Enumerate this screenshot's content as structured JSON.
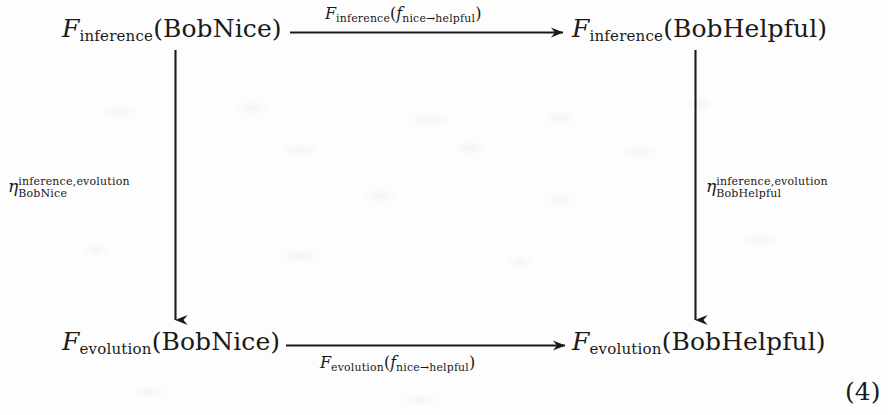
{
  "diagram": {
    "type": "commutative-square",
    "equation_number": "(4)",
    "nodes": {
      "top_left": {
        "functor": "F",
        "functor_sub": "inference",
        "argument": "(BobNice)",
        "full_text": "F_inference(BobNice)"
      },
      "top_right": {
        "functor": "F",
        "functor_sub": "inference",
        "argument": "(BobHelpful)",
        "full_text": "F_inference(BobHelpful)"
      },
      "bottom_left": {
        "functor": "F",
        "functor_sub": "evolution",
        "argument": "(BobNice)",
        "full_text": "F_evolution(BobNice)"
      },
      "bottom_right": {
        "functor": "F",
        "functor_sub": "evolution",
        "argument": "(BobHelpful)",
        "full_text": "F_evolution(BobHelpful)"
      }
    },
    "arrows": {
      "top": {
        "direction": "right",
        "label_functor": "F",
        "label_functor_sub": "inference",
        "label_open": "(",
        "label_map": "f",
        "label_map_sub": "nice→helpful",
        "label_close": ")",
        "label_position": "above"
      },
      "bottom": {
        "direction": "right",
        "label_functor": "F",
        "label_functor_sub": "evolution",
        "label_open": "(",
        "label_map": "f",
        "label_map_sub": "nice→helpful",
        "label_close": ")",
        "label_position": "below"
      },
      "left": {
        "direction": "down",
        "label_glyph": "η",
        "label_super": "inference,evolution",
        "label_sub": "BobNice",
        "label_position": "left"
      },
      "right": {
        "direction": "down",
        "label_glyph": "η",
        "label_super": "inference,evolution",
        "label_sub": "BobHelpful",
        "label_position": "left"
      }
    },
    "colors": {
      "ink": "#1a1a1a",
      "page": "#fdfdfd"
    }
  }
}
